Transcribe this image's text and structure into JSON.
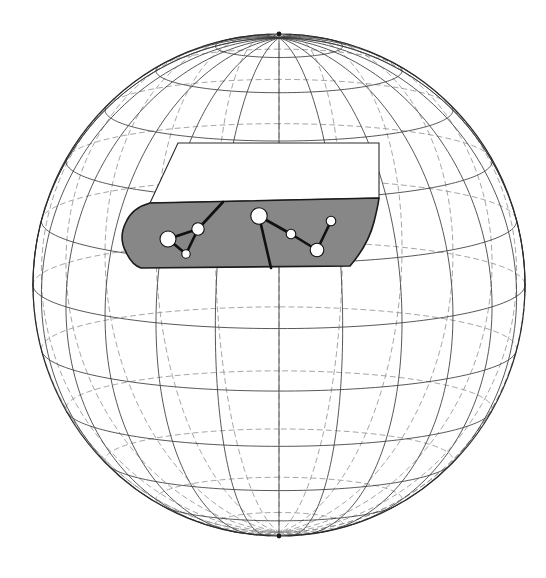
{
  "figure": {
    "canvas": {
      "width": 546,
      "height": 578
    },
    "background_color": "#ffffff"
  },
  "sphere": {
    "name": "celestial-sphere",
    "center_x": 279,
    "center_y": 285,
    "radius_x": 246,
    "radius_y": 251,
    "outline_color": "#2b2b2b",
    "outline_width": 1.2,
    "pole_north": {
      "x": 279,
      "y": 34
    },
    "pole_south": {
      "x": 279,
      "y": 536
    }
  },
  "graticule": {
    "meridian_count": 12,
    "meridian_step_deg": 15,
    "parallel_count": 11,
    "parallel_step_deg": 15,
    "front_line_color": "#3a3a3a",
    "back_line_color": "#8d8d8d",
    "front_line_width": 0.85,
    "back_line_width": 0.8,
    "back_dash_pattern": "5,4",
    "parallel_latitudes_deg": [
      75,
      60,
      45,
      30,
      15,
      0,
      -15,
      -30,
      -45,
      -60,
      -75
    ],
    "meridian_longitudes_deg": [
      -90,
      -75,
      -60,
      -45,
      -30,
      -15,
      0,
      15,
      30,
      45,
      60,
      75,
      90
    ]
  },
  "band": {
    "name": "shaded-sky-band",
    "fill_color": "#878787",
    "stroke_color": "#1a1a1a",
    "stroke_width": 1.6,
    "description": "grey zodiacal band sweeping across the northern mid-latitudes",
    "path": "M 141 268 L 350 266 C 362 252 370 238 374 222 C 378 206 379 198 379 198 L 150 203 C 139 206 130 213 126 222 C 121 232 121 243 126 252 C 130 261 135 266 141 268 Z"
  },
  "white_mask": {
    "name": "white-occlusion-panel",
    "fill_color": "#ffffff",
    "stroke_color": "#2b2b2b",
    "stroke_width": 1.1,
    "description": "white trapezoid masking the sphere above the band",
    "path": "M 178 143 L 379 143 L 379 198 L 150 203 Z"
  },
  "constellation": {
    "name": "constellation-figure",
    "star_fill": "#ffffff",
    "star_stroke": "#111111",
    "star_stroke_width": 1.1,
    "link_color": "#111111",
    "link_width": 2.6,
    "stars": [
      {
        "id": "s1",
        "label": "star-left-bright",
        "x": 168,
        "y": 239,
        "r": 8.0
      },
      {
        "id": "s2",
        "label": "star-left-mid",
        "x": 198,
        "y": 229,
        "r": 6.2
      },
      {
        "id": "s3",
        "label": "star-left-faint",
        "x": 186,
        "y": 254,
        "r": 4.2
      },
      {
        "id": "s4",
        "label": "star-center-bright",
        "x": 259,
        "y": 216,
        "r": 8.2
      },
      {
        "id": "s5",
        "label": "star-right-faint-a",
        "x": 291,
        "y": 234,
        "r": 4.8
      },
      {
        "id": "s6",
        "label": "star-right-mid",
        "x": 317,
        "y": 250,
        "r": 6.8
      },
      {
        "id": "s7",
        "label": "star-right-faint-b",
        "x": 331,
        "y": 221,
        "r": 4.8
      }
    ],
    "links": [
      {
        "from": "s1",
        "to": "s2"
      },
      {
        "from": "s1",
        "to": "s3"
      },
      {
        "from": "s2",
        "to": "s3"
      },
      {
        "from": "s4",
        "to": "s5"
      },
      {
        "from": "s5",
        "to": "s6"
      },
      {
        "from": "s6",
        "to": "s7"
      }
    ],
    "open_rays": [
      {
        "label": "ray-from-left-mid-to-band-edge",
        "x1": 198,
        "y1": 229,
        "x2": 223,
        "y2": 202
      },
      {
        "label": "ray-from-center-bright-to-band-edge",
        "x1": 259,
        "y1": 216,
        "x2": 271,
        "y2": 268
      }
    ]
  },
  "chart_data": {
    "type": "scatter",
    "xlabel": "",
    "ylabel": "",
    "grid": true,
    "legend": "none",
    "x": [
      168,
      198,
      186,
      259,
      291,
      317,
      331
    ],
    "y": [
      239,
      229,
      254,
      216,
      234,
      250,
      221
    ],
    "sizes": [
      8.0,
      6.2,
      4.2,
      8.2,
      4.8,
      6.8,
      4.8
    ],
    "point_labels": [
      "star-left-bright",
      "star-left-mid",
      "star-left-faint",
      "star-center-bright",
      "star-right-faint-a",
      "star-right-mid",
      "star-right-faint-b"
    ],
    "edges": [
      [
        0,
        1
      ],
      [
        0,
        2
      ],
      [
        1,
        2
      ],
      [
        3,
        4
      ],
      [
        4,
        5
      ],
      [
        5,
        6
      ]
    ],
    "xlim": [
      33,
      525
    ],
    "ylim": [
      34,
      536
    ]
  }
}
